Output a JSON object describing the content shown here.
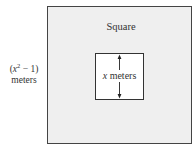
{
  "diagram": {
    "type": "nested-squares",
    "outer_square": {
      "label": "Square",
      "side_length_expr": {
        "open": "(",
        "var": "x",
        "exponent": "2",
        "rest": " − 1)",
        "unit": "meters"
      },
      "fill": "#efefef",
      "stroke": "#444444"
    },
    "inner_square": {
      "side_length": {
        "var": "x",
        "unit": " meters"
      },
      "fill": "#ffffff",
      "stroke": "#333333",
      "dimension_arrow": "vertical-double-headed"
    }
  }
}
